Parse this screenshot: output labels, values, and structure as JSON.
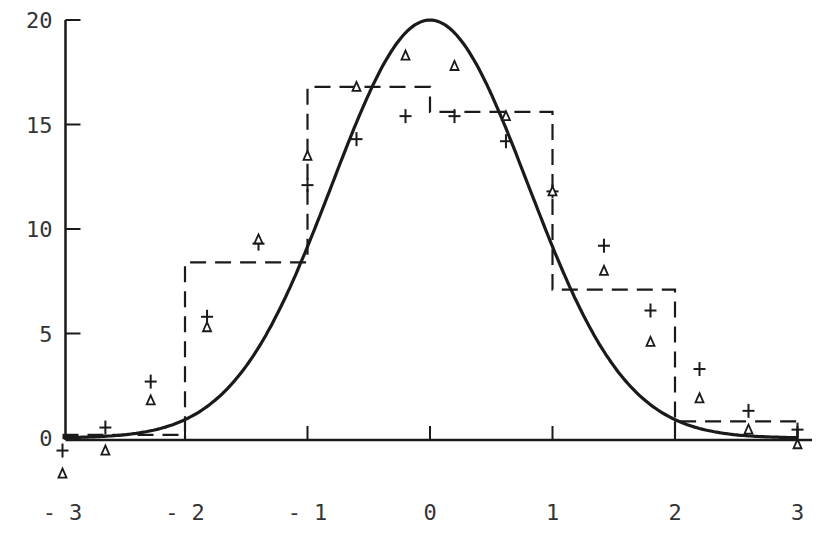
{
  "chart_data": {
    "type": "line",
    "title": "",
    "xlabel": "",
    "ylabel": "",
    "xlim": [
      -3,
      3
    ],
    "ylim": [
      0,
      20
    ],
    "grid": false,
    "x_ticks": [
      -3,
      -2,
      -1,
      0,
      1,
      2,
      3
    ],
    "x_tick_labels": [
      "-3",
      "-2",
      "-1",
      "0",
      "1",
      "2",
      "3"
    ],
    "y_ticks": [
      0,
      5,
      10,
      15,
      20
    ],
    "y_tick_labels": [
      "0",
      "5",
      "10",
      "15",
      "20"
    ],
    "series": [
      {
        "name": "normal curve",
        "style": "solid",
        "kind": "curve",
        "peak": 20,
        "mean": 0,
        "sd": 0.8
      },
      {
        "name": "histogram",
        "style": "dashed-step",
        "bins": [
          [
            -3,
            -2
          ],
          [
            -2,
            -1
          ],
          [
            -1,
            0
          ],
          [
            0,
            1
          ],
          [
            1,
            2
          ],
          [
            2,
            3
          ]
        ],
        "values": [
          0.15,
          8.4,
          16.8,
          15.6,
          7.1,
          0.8
        ]
      },
      {
        "name": "plus markers",
        "marker": "+",
        "x": [
          -3.0,
          -2.65,
          -2.28,
          -1.82,
          -1.4,
          -1.0,
          -0.6,
          -0.2,
          0.2,
          0.62,
          1.0,
          1.42,
          1.8,
          2.2,
          2.6,
          3.0
        ],
        "values": [
          -0.6,
          0.5,
          2.7,
          5.8,
          9.3,
          12.1,
          14.3,
          15.4,
          15.4,
          14.2,
          11.8,
          9.2,
          6.1,
          3.3,
          1.3,
          0.4
        ]
      },
      {
        "name": "triangle markers",
        "marker": "triangle",
        "x": [
          -3.0,
          -2.65,
          -2.28,
          -1.82,
          -1.4,
          -1.0,
          -0.6,
          -0.2,
          0.2,
          0.62,
          1.0,
          1.42,
          1.8,
          2.2,
          2.6,
          3.0
        ],
        "values": [
          -1.7,
          -0.6,
          1.8,
          5.3,
          9.5,
          13.5,
          16.8,
          18.3,
          17.8,
          15.4,
          11.8,
          8.0,
          4.6,
          1.9,
          0.4,
          -0.3
        ]
      }
    ],
    "legend": null
  }
}
